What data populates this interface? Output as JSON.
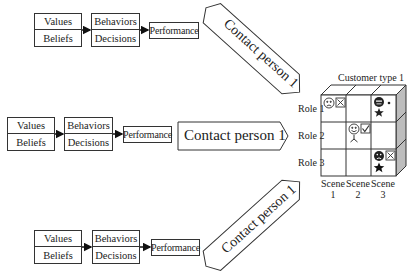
{
  "flows": [
    {
      "id": "top",
      "values_beliefs": {
        "top": "Values",
        "bottom": "Beliefs"
      },
      "behaviors_decisions": {
        "top": "Behaviors",
        "bottom": "Decisions"
      },
      "performance": "Performance",
      "contact": "Contact person 1",
      "contact_orientation": "rotated-down-right"
    },
    {
      "id": "middle",
      "values_beliefs": {
        "top": "Values",
        "bottom": "Beliefs"
      },
      "behaviors_decisions": {
        "top": "Behaviors",
        "bottom": "Decisions"
      },
      "performance": "Performance",
      "contact": "Contact person 1",
      "contact_orientation": "horizontal"
    },
    {
      "id": "bottom",
      "values_beliefs": {
        "top": "Values",
        "bottom": "Beliefs"
      },
      "behaviors_decisions": {
        "top": "Behaviors",
        "bottom": "Decisions"
      },
      "performance": "Performance",
      "contact": "Contact person 1",
      "contact_orientation": "rotated-up-right"
    }
  ],
  "cube": {
    "title": "Customer type 1",
    "roles": [
      "Role 1",
      "Role 2",
      "Role 3"
    ],
    "scenes": [
      {
        "line1": "Scene",
        "line2": "1"
      },
      {
        "line1": "Scene",
        "line2": "2"
      },
      {
        "line1": "Scene",
        "line2": "3"
      }
    ],
    "cells": [
      {
        "role": 1,
        "scene": 1,
        "icons": [
          "sad-face",
          "x-box"
        ]
      },
      {
        "role": 1,
        "scene": 3,
        "icons": [
          "filled-face",
          "dot",
          "star"
        ]
      },
      {
        "role": 2,
        "scene": 2,
        "icons": [
          "smile-face",
          "check-box",
          "tripod"
        ]
      },
      {
        "role": 3,
        "scene": 3,
        "icons": [
          "filled-sad-face",
          "x-box",
          "filled-star"
        ]
      }
    ]
  }
}
